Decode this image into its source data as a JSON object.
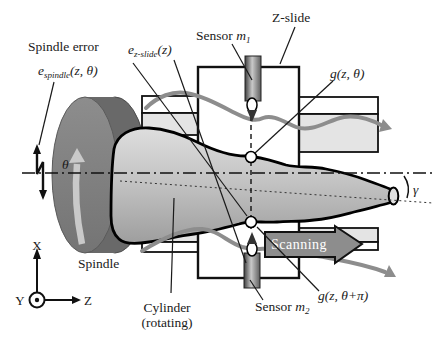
{
  "figure": {
    "title_hint": "Cylinder form error separation measurement setup",
    "labels": {
      "spindle_error": "Spindle error",
      "e_spindle": {
        "base": "e",
        "sub": "spindle",
        "args": "(z, θ)"
      },
      "e_zslide": {
        "base": "e",
        "sub": "z-slide",
        "args": "(z)"
      },
      "sensor_m1": {
        "word": "Sensor ",
        "var": "m",
        "sub": "1"
      },
      "sensor_m2": {
        "word": "Sensor ",
        "var": "m",
        "sub": "2"
      },
      "z_slide": "Z-slide",
      "g_theta": "g(z, θ)",
      "g_theta_pi": "g(z, θ+π)",
      "gamma": "γ",
      "theta": "θ",
      "scanning": "Scanning",
      "spindle": "Spindle",
      "cylinder_line1": "Cylinder",
      "cylinder_line2": "(rotating)",
      "axis_x": "X",
      "axis_y": "Y",
      "axis_z": "Z"
    },
    "colors": {
      "signal_curve": "#8d8d8d",
      "scan_arrow_fill": "#8d8d8d",
      "rail_gray": "#e4e4e4",
      "rail_white": "#ffffff",
      "outline": "#111111",
      "cylinder_top": "#dedede",
      "cylinder_mid": "#c4c4c4",
      "cylinder_bottom": "#9e9e9e",
      "spindle_face": "#838383",
      "spindle_back": "#696969",
      "rotation_arrow": "#c9c9c9"
    }
  }
}
